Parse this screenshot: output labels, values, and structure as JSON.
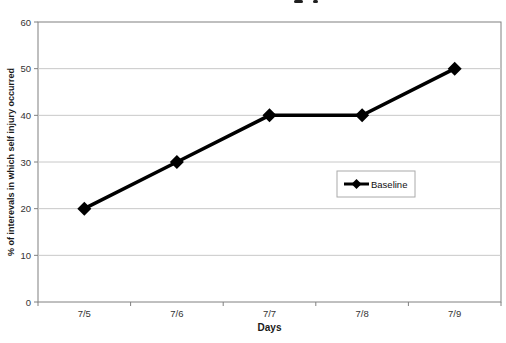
{
  "chart_data": {
    "type": "line",
    "categories": [
      "7/5",
      "7/6",
      "7/7",
      "7/8",
      "7/9"
    ],
    "series": [
      {
        "name": "Baseline",
        "values": [
          20,
          30,
          40,
          40,
          50
        ],
        "color": "#000000",
        "marker": "diamond"
      }
    ],
    "xlabel": "Days",
    "ylabel": "% of interevals in which self injury occurred",
    "ylim": [
      0,
      60
    ],
    "yticks": [
      0,
      10,
      20,
      30,
      40,
      50,
      60
    ],
    "grid": "horizontal",
    "legend_position": "center-right",
    "legend_entries": [
      "Baseline"
    ]
  },
  "colors": {
    "line": "#000000",
    "gridline": "#c8c8c8",
    "axis": "#808080",
    "tick_label": "#333333",
    "axis_title": "#1a1a1a",
    "background": "#ffffff",
    "legend_border": "#aaaaaa",
    "title_fragment": "#1f1f1f"
  }
}
